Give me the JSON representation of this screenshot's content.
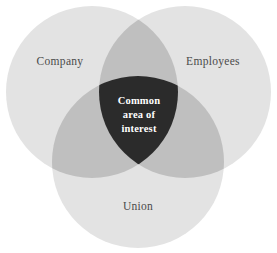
{
  "diagram": {
    "type": "venn",
    "set_count": 3,
    "background_color": "#ffffff",
    "colors": {
      "circle_fill": "#e3e3e3",
      "pair_overlap_fill": "#bfbfbf",
      "triple_overlap_fill": "#2b2b2b",
      "label_text": "#4a4a4a",
      "center_text": "#ffffff"
    },
    "sets": [
      {
        "id": "company",
        "label": "Company",
        "position": "top-left",
        "cx": 92,
        "cy": 92,
        "r": 86,
        "label_x": 60,
        "label_y": 65
      },
      {
        "id": "employees",
        "label": "Employees",
        "position": "top-right",
        "cx": 185,
        "cy": 92,
        "r": 86,
        "label_x": 213,
        "label_y": 65
      },
      {
        "id": "union",
        "label": "Union",
        "position": "bottom-center",
        "cx": 138,
        "cy": 162,
        "r": 86,
        "label_x": 138,
        "label_y": 210
      }
    ],
    "intersection": {
      "id": "common-area-of-interest",
      "text_lines": [
        "Common",
        "area of",
        "interest"
      ],
      "full_text": "Common area of interest",
      "center_x": 139,
      "center_y": 118
    }
  }
}
